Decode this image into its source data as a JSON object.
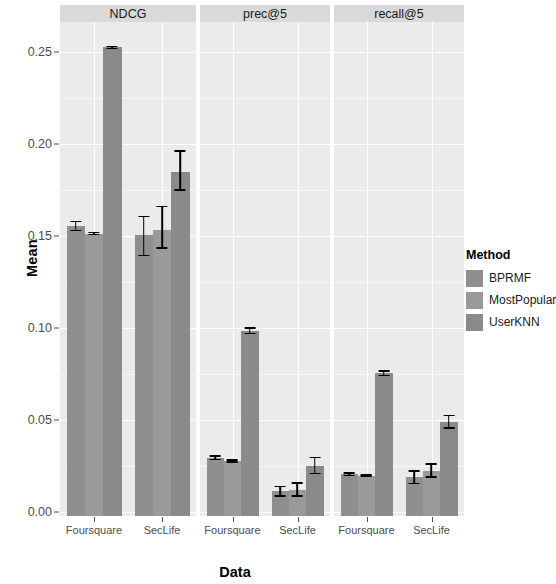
{
  "chart_data": {
    "type": "bar",
    "title": "",
    "xlabel": "Data",
    "ylabel": "Mean",
    "ylim": [
      0.0,
      0.262
    ],
    "grid": true,
    "legend_position": "right",
    "legend_title": "Method",
    "facet_variable": "metric",
    "facets": [
      "NDCG",
      "prec@5",
      "recall@5"
    ],
    "categories": [
      "Foursquare",
      "SecLife"
    ],
    "series": [
      "BPRMF",
      "MostPopular",
      "UserKNN"
    ],
    "ytick_labels": [
      "0.00",
      "0.05",
      "0.10",
      "0.15",
      "0.20",
      "0.25"
    ],
    "ytick_values": [
      0.0,
      0.05,
      0.1,
      0.15,
      0.2,
      0.25
    ],
    "panels": [
      {
        "facet": "NDCG",
        "groups": [
          {
            "category": "Foursquare",
            "bars": [
              {
                "method": "BPRMF",
                "value": 0.1555,
                "err_low": 0.1525,
                "err_high": 0.1583
              },
              {
                "method": "MostPopular",
                "value": 0.1513,
                "err_low": 0.1503,
                "err_high": 0.1523
              },
              {
                "method": "UserKNN",
                "value": 0.2525,
                "err_low": 0.2515,
                "err_high": 0.2535
              }
            ]
          },
          {
            "category": "SecLife",
            "bars": [
              {
                "method": "BPRMF",
                "value": 0.1505,
                "err_low": 0.139,
                "err_high": 0.161
              },
              {
                "method": "MostPopular",
                "value": 0.1535,
                "err_low": 0.143,
                "err_high": 0.1665
              },
              {
                "method": "UserKNN",
                "value": 0.185,
                "err_low": 0.1745,
                "err_high": 0.1965
              }
            ]
          }
        ]
      },
      {
        "facet": "prec@5",
        "groups": [
          {
            "category": "Foursquare",
            "bars": [
              {
                "method": "BPRMF",
                "value": 0.0295,
                "err_low": 0.0281,
                "err_high": 0.0309
              },
              {
                "method": "MostPopular",
                "value": 0.0278,
                "err_low": 0.0268,
                "err_high": 0.0288
              },
              {
                "method": "UserKNN",
                "value": 0.0985,
                "err_low": 0.0965,
                "err_high": 0.1005
              }
            ]
          },
          {
            "category": "SecLife",
            "bars": [
              {
                "method": "BPRMF",
                "value": 0.0112,
                "err_low": 0.0082,
                "err_high": 0.0142
              },
              {
                "method": "MostPopular",
                "value": 0.0118,
                "err_low": 0.0082,
                "err_high": 0.0162
              },
              {
                "method": "UserKNN",
                "value": 0.025,
                "err_low": 0.0205,
                "err_high": 0.03
              }
            ]
          }
        ]
      },
      {
        "facet": "recall@5",
        "groups": [
          {
            "category": "Foursquare",
            "bars": [
              {
                "method": "BPRMF",
                "value": 0.0205,
                "err_low": 0.0193,
                "err_high": 0.0217
              },
              {
                "method": "MostPopular",
                "value": 0.0198,
                "err_low": 0.019,
                "err_high": 0.0206
              },
              {
                "method": "UserKNN",
                "value": 0.0755,
                "err_low": 0.0738,
                "err_high": 0.0772
              }
            ]
          },
          {
            "category": "SecLife",
            "bars": [
              {
                "method": "BPRMF",
                "value": 0.0188,
                "err_low": 0.015,
                "err_high": 0.0226
              },
              {
                "method": "MostPopular",
                "value": 0.0225,
                "err_low": 0.0186,
                "err_high": 0.0264
              },
              {
                "method": "UserKNN",
                "value": 0.049,
                "err_low": 0.0452,
                "err_high": 0.0528
              }
            ]
          }
        ]
      }
    ],
    "colors": {
      "BPRMF": "#8f8f8f",
      "MostPopular": "#9a9a9a",
      "UserKNN": "#8a8a8a",
      "panel_background": "#ebebeb",
      "strip_background": "#d9d9d9",
      "gridline": "#ffffff",
      "error_bar": "#000000",
      "axis_text": "#4d4d4d"
    }
  },
  "legend": {
    "title": "Method",
    "items": [
      {
        "label": "BPRMF",
        "color": "#8f8f8f"
      },
      {
        "label": "MostPopular",
        "color": "#9a9a9a"
      },
      {
        "label": "UserKNN",
        "color": "#8a8a8a"
      }
    ]
  },
  "axes": {
    "y_title": "Mean",
    "x_title": "Data"
  }
}
